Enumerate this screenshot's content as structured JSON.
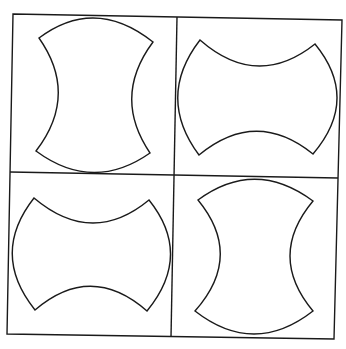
{
  "diagram": {
    "type": "2x2 tile grid",
    "stroke_color": "#1a1a1a",
    "background_color": "#ffffff",
    "cells": [
      {
        "position": "top-left",
        "orientation": "vertical",
        "convex_sides": [
          "top",
          "bottom"
        ],
        "concave_sides": [
          "left",
          "right"
        ]
      },
      {
        "position": "top-right",
        "orientation": "horizontal",
        "convex_sides": [
          "left",
          "right"
        ],
        "concave_sides": [
          "top",
          "bottom"
        ]
      },
      {
        "position": "bottom-left",
        "orientation": "horizontal",
        "convex_sides": [
          "left",
          "right"
        ],
        "concave_sides": [
          "top",
          "bottom"
        ]
      },
      {
        "position": "bottom-right",
        "orientation": "vertical",
        "convex_sides": [
          "top",
          "bottom"
        ],
        "concave_sides": [
          "left",
          "right"
        ]
      }
    ]
  }
}
